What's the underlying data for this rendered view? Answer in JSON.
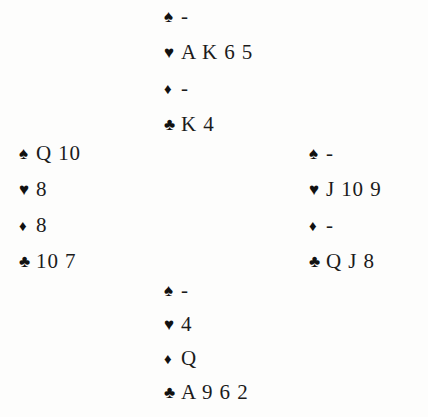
{
  "diagram": {
    "type": "bridge-hand-diagram",
    "suit_symbols": {
      "spade": "♠",
      "heart": "♥",
      "diamond": "♦",
      "club": "♣"
    },
    "void_marker": "-",
    "colors": {
      "ink": "#1a1a1a",
      "background": "#fdfdfc"
    },
    "hands": {
      "north": {
        "position": "north",
        "suits": [
          {
            "suit": "spade",
            "symbol": "♠",
            "cards": "-"
          },
          {
            "suit": "heart",
            "symbol": "♥",
            "cards": "A K 6 5"
          },
          {
            "suit": "diamond",
            "symbol": "♦",
            "cards": "-"
          },
          {
            "suit": "club",
            "symbol": "♣",
            "cards": "K 4"
          }
        ]
      },
      "west": {
        "position": "west",
        "suits": [
          {
            "suit": "spade",
            "symbol": "♠",
            "cards": "Q 10"
          },
          {
            "suit": "heart",
            "symbol": "♥",
            "cards": "8"
          },
          {
            "suit": "diamond",
            "symbol": "♦",
            "cards": "8"
          },
          {
            "suit": "club",
            "symbol": "♣",
            "cards": "10 7"
          }
        ]
      },
      "east": {
        "position": "east",
        "suits": [
          {
            "suit": "spade",
            "symbol": "♠",
            "cards": "-"
          },
          {
            "suit": "heart",
            "symbol": "♥",
            "cards": "J 10 9"
          },
          {
            "suit": "diamond",
            "symbol": "♦",
            "cards": "-"
          },
          {
            "suit": "club",
            "symbol": "♣",
            "cards": "Q J 8"
          }
        ]
      },
      "south": {
        "position": "south",
        "suits": [
          {
            "suit": "spade",
            "symbol": "♠",
            "cards": "-"
          },
          {
            "suit": "heart",
            "symbol": "♥",
            "cards": "4"
          },
          {
            "suit": "diamond",
            "symbol": "♦",
            "cards": "Q"
          },
          {
            "suit": "club",
            "symbol": "♣",
            "cards": "A 9 6 2"
          }
        ]
      }
    }
  }
}
